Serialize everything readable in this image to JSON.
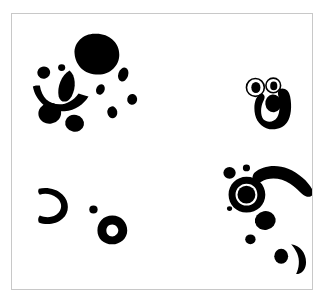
{
  "figure": {
    "title": "",
    "caption": "",
    "width": 328,
    "height": 304,
    "background_color": "#ffffff",
    "ink_color": "#000000",
    "frame": {
      "visible": true,
      "color": "#c8c8c8",
      "line_width": 1,
      "x": 11,
      "y": 13,
      "width": 302,
      "height": 277
    }
  },
  "chart_data": {
    "type": "scatter",
    "title": "",
    "subtitle": "",
    "xlabel": "",
    "ylabel": "",
    "xlim": [
      0,
      302
    ],
    "ylim": [
      0,
      277
    ],
    "grid": false,
    "legend": "none",
    "tick_labels_x": [],
    "tick_labels_y": [],
    "annotations": [],
    "clusters": [
      {
        "name": "upper-left-cluster",
        "blob_count": 13,
        "centroid": [
          73,
          70
        ],
        "description": "Large round blob with satellite dots, an arc stroke and a teardrop, resembling a face"
      },
      {
        "name": "upper-right-cluster",
        "blob_count": 4,
        "centroid": [
          265,
          100
        ],
        "description": "Two small outlined rings above a thick hooked U-shape containing a filled oval"
      },
      {
        "name": "lower-left-cluster",
        "blob_count": 4,
        "centroid": [
          85,
          215
        ],
        "description": "Open hook stroke, small dot and a ring with white center"
      },
      {
        "name": "lower-right-cluster",
        "blob_count": 8,
        "centroid": [
          265,
          210
        ],
        "description": "Ring with thick rim, curved banana stroke, scattered dots and a crescent"
      }
    ],
    "shapes": [
      {
        "id": "s01",
        "cluster": "upper-left-cluster",
        "kind": "ellipse-filled",
        "cx": 85,
        "cy": 40,
        "rx": 22,
        "ry": 19,
        "rotation": -12,
        "color": "#000000"
      },
      {
        "id": "s02",
        "cluster": "upper-left-cluster",
        "kind": "ellipse-filled",
        "cx": 32,
        "cy": 59,
        "rx": 6,
        "ry": 6,
        "rotation": 0,
        "color": "#000000"
      },
      {
        "id": "s03",
        "cluster": "upper-left-cluster",
        "kind": "ellipse-filled",
        "cx": 50,
        "cy": 55,
        "rx": 3.5,
        "ry": 3.5,
        "rotation": 0,
        "color": "#000000"
      },
      {
        "id": "s04",
        "cluster": "upper-left-cluster",
        "kind": "teardrop",
        "cx": 55,
        "cy": 72,
        "rx": 8,
        "ry": 16,
        "rotation": 18,
        "color": "#000000"
      },
      {
        "id": "s05",
        "cluster": "upper-left-cluster",
        "kind": "arc-stroke",
        "cx": 48,
        "cy": 72,
        "rx": 28,
        "ry": 22,
        "rotation": 0,
        "color": "#000000"
      },
      {
        "id": "s06",
        "cluster": "upper-left-cluster",
        "kind": "ellipse-filled",
        "cx": 38,
        "cy": 100,
        "rx": 11,
        "ry": 10,
        "rotation": 0,
        "color": "#000000"
      },
      {
        "id": "s07",
        "cluster": "upper-left-cluster",
        "kind": "ellipse-filled",
        "cx": 63,
        "cy": 109,
        "rx": 9,
        "ry": 8,
        "rotation": 0,
        "color": "#000000"
      },
      {
        "id": "s08",
        "cluster": "upper-left-cluster",
        "kind": "ellipse-filled",
        "cx": 89,
        "cy": 76,
        "rx": 4,
        "ry": 5,
        "rotation": 20,
        "color": "#000000"
      },
      {
        "id": "s09",
        "cluster": "upper-left-cluster",
        "kind": "ellipse-filled",
        "cx": 112,
        "cy": 61,
        "rx": 5,
        "ry": 7,
        "rotation": 15,
        "color": "#000000"
      },
      {
        "id": "s10",
        "cluster": "upper-left-cluster",
        "kind": "ellipse-filled",
        "cx": 101,
        "cy": 98,
        "rx": 5,
        "ry": 6,
        "rotation": 0,
        "color": "#000000"
      },
      {
        "id": "s11",
        "cluster": "upper-left-cluster",
        "kind": "ellipse-filled",
        "cx": 120,
        "cy": 86,
        "rx": 5,
        "ry": 5,
        "rotation": 0,
        "color": "#000000"
      },
      {
        "id": "s12",
        "cluster": "upper-left-cluster",
        "kind": "ellipse-filled",
        "cx": 95,
        "cy": 36,
        "rx": 4,
        "ry": 4,
        "rotation": 0,
        "color": "#000000"
      },
      {
        "id": "s13",
        "cluster": "upper-right-cluster",
        "kind": "ring-outline",
        "cx": 245,
        "cy": 75,
        "rx": 9,
        "ry": 8,
        "stroke": 2,
        "color": "#000000"
      },
      {
        "id": "s14",
        "cluster": "upper-right-cluster",
        "kind": "ring-outline",
        "cx": 262,
        "cy": 73,
        "rx": 7,
        "ry": 7,
        "stroke": 2,
        "color": "#000000"
      },
      {
        "id": "s15",
        "cluster": "upper-right-cluster",
        "kind": "hook-u",
        "cx": 265,
        "cy": 95,
        "rx": 18,
        "ry": 20,
        "rotation": 0,
        "color": "#000000"
      },
      {
        "id": "s16",
        "cluster": "upper-right-cluster",
        "kind": "ellipse-filled",
        "cx": 264,
        "cy": 87,
        "rx": 8,
        "ry": 9,
        "rotation": 0,
        "color": "#000000"
      },
      {
        "id": "s17",
        "cluster": "lower-left-cluster",
        "kind": "hook-open",
        "cx": 40,
        "cy": 193,
        "rx": 14,
        "ry": 16,
        "rotation": 0,
        "color": "#000000"
      },
      {
        "id": "s18",
        "cluster": "lower-left-cluster",
        "kind": "ellipse-filled",
        "cx": 82,
        "cy": 197,
        "rx": 4,
        "ry": 4,
        "rotation": 0,
        "color": "#000000"
      },
      {
        "id": "s19",
        "cluster": "lower-left-cluster",
        "kind": "ring-thick",
        "cx": 101,
        "cy": 217,
        "rx": 13,
        "ry": 13,
        "stroke": 7,
        "color": "#000000"
      },
      {
        "id": "s20",
        "cluster": "lower-right-cluster",
        "kind": "ellipse-filled",
        "cx": 219,
        "cy": 161,
        "rx": 6,
        "ry": 6,
        "rotation": 0,
        "color": "#000000"
      },
      {
        "id": "s21",
        "cluster": "lower-right-cluster",
        "kind": "ellipse-filled",
        "cx": 236,
        "cy": 156,
        "rx": 3.5,
        "ry": 3.5,
        "rotation": 0,
        "color": "#000000"
      },
      {
        "id": "s22",
        "cluster": "lower-right-cluster",
        "kind": "banana",
        "cx": 268,
        "cy": 168,
        "rx": 42,
        "ry": 13,
        "rotation": 16,
        "color": "#000000"
      },
      {
        "id": "s23",
        "cluster": "lower-right-cluster",
        "kind": "ring-thick",
        "cx": 236,
        "cy": 182,
        "rx": 19,
        "ry": 18,
        "stroke": 7,
        "color": "#000000"
      },
      {
        "id": "s24",
        "cluster": "lower-right-cluster",
        "kind": "ellipse-filled",
        "cx": 220,
        "cy": 196,
        "rx": 2.5,
        "ry": 2.5,
        "rotation": 0,
        "color": "#000000"
      },
      {
        "id": "s25",
        "cluster": "lower-right-cluster",
        "kind": "ellipse-filled",
        "cx": 255,
        "cy": 208,
        "rx": 10,
        "ry": 9,
        "rotation": 0,
        "color": "#000000"
      },
      {
        "id": "s26",
        "cluster": "lower-right-cluster",
        "kind": "ellipse-filled",
        "cx": 240,
        "cy": 226,
        "rx": 5,
        "ry": 5,
        "rotation": 0,
        "color": "#000000"
      },
      {
        "id": "s27",
        "cluster": "lower-right-cluster",
        "kind": "ellipse-filled",
        "cx": 272,
        "cy": 243,
        "rx": 7,
        "ry": 7,
        "rotation": 0,
        "color": "#000000"
      },
      {
        "id": "s28",
        "cluster": "lower-right-cluster",
        "kind": "crescent",
        "cx": 285,
        "cy": 245,
        "rx": 12,
        "ry": 14,
        "rotation": 0,
        "color": "#000000"
      }
    ]
  }
}
